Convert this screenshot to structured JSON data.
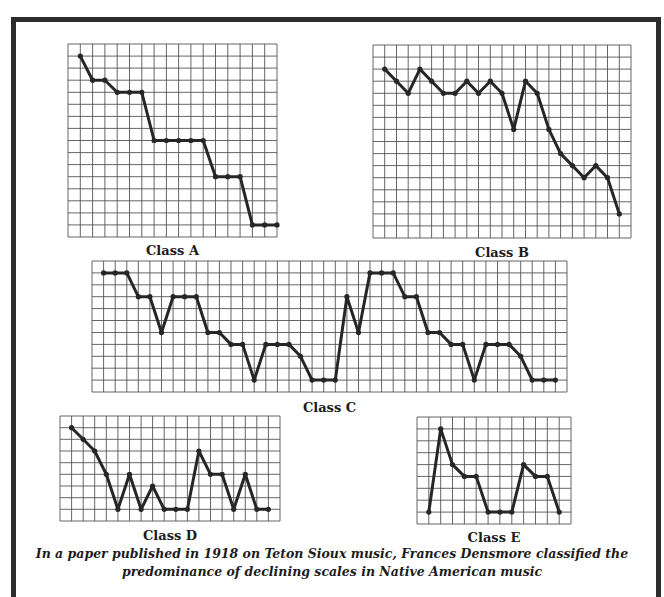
{
  "style": {
    "grid_color": "#555555",
    "line_color": "#262626",
    "frame_color": "#2b2b2b"
  },
  "caption": {
    "line1": "In a paper published in 1918 on Teton Sioux music, Frances Densmore classified the",
    "line2": "predominance of declining scales in Native American music"
  },
  "chart_data": [
    {
      "type": "line",
      "title": "Class A",
      "xlabel": "",
      "ylabel": "",
      "grid": true,
      "cols": 17,
      "rows": 16,
      "note": "values = grid steps below top edge (higher number = lower pitch)",
      "x": [
        1,
        2,
        3,
        4,
        5,
        6,
        7,
        8,
        9,
        10,
        11,
        12,
        13,
        14,
        15,
        16,
        17
      ],
      "values": [
        1,
        3,
        3,
        4,
        4,
        4,
        8,
        8,
        8,
        8,
        8,
        11,
        11,
        11,
        15,
        15,
        15
      ]
    },
    {
      "type": "line",
      "title": "Class B",
      "xlabel": "",
      "ylabel": "",
      "grid": true,
      "cols": 22,
      "rows": 16,
      "note": "values = grid steps below top edge",
      "x": [
        1,
        2,
        3,
        4,
        5,
        6,
        7,
        8,
        9,
        10,
        11,
        12,
        13,
        14,
        15,
        16,
        17,
        18,
        19,
        20,
        21
      ],
      "values": [
        2,
        3,
        4,
        2,
        3,
        4,
        4,
        3,
        4,
        3,
        4,
        7,
        3,
        4,
        7,
        9,
        10,
        11,
        10,
        11,
        14
      ]
    },
    {
      "type": "line",
      "title": "Class C",
      "xlabel": "",
      "ylabel": "",
      "grid": true,
      "cols": 41,
      "rows": 11,
      "note": "values = grid steps below top edge",
      "x": [
        1,
        2,
        3,
        4,
        5,
        6,
        7,
        8,
        9,
        10,
        11,
        12,
        13,
        14,
        15,
        16,
        17,
        18,
        19,
        20,
        21,
        22,
        23,
        24,
        25,
        26,
        27,
        28,
        29,
        30,
        31,
        32,
        33,
        34,
        35,
        36,
        37,
        38,
        39,
        40
      ],
      "values": [
        1,
        1,
        1,
        3,
        3,
        6,
        3,
        3,
        3,
        6,
        6,
        7,
        7,
        10,
        7,
        7,
        7,
        8,
        10,
        10,
        10,
        3,
        6,
        1,
        1,
        1,
        3,
        3,
        6,
        6,
        7,
        7,
        10,
        7,
        7,
        7,
        8,
        10,
        10,
        10
      ]
    },
    {
      "type": "line",
      "title": "Class D",
      "xlabel": "",
      "ylabel": "",
      "grid": true,
      "cols": 19,
      "rows": 9,
      "note": "values = grid steps below top edge",
      "x": [
        1,
        2,
        3,
        4,
        5,
        6,
        7,
        8,
        9,
        10,
        11,
        12,
        13,
        14,
        15,
        16,
        17,
        18
      ],
      "values": [
        1,
        2,
        3,
        5,
        8,
        5,
        8,
        6,
        8,
        8,
        8,
        3,
        5,
        5,
        8,
        5,
        8,
        8
      ]
    },
    {
      "type": "line",
      "title": "Class E",
      "xlabel": "",
      "ylabel": "",
      "grid": true,
      "cols": 13,
      "rows": 9,
      "note": "values = grid steps below top edge",
      "x": [
        1,
        2,
        3,
        4,
        5,
        6,
        7,
        8,
        9,
        10,
        11,
        12
      ],
      "values": [
        8,
        1,
        4,
        5,
        5,
        8,
        8,
        8,
        4,
        5,
        5,
        8
      ]
    }
  ]
}
